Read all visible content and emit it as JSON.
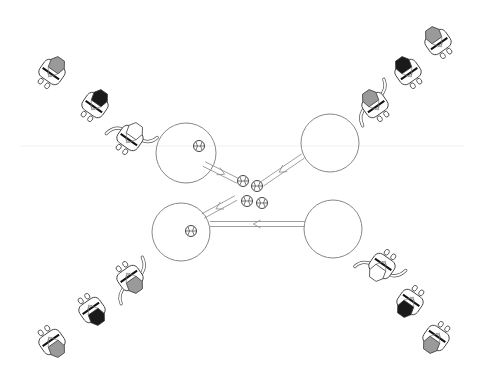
{
  "diagram": {
    "type": "drill-diagram",
    "background": "#ffffff",
    "stroke_color": "#777777",
    "colors": {
      "gray_shirt": "#9a9a9a",
      "black_shirt": "#1a1a1a",
      "outline": "#444444"
    },
    "guide_line_y": 146,
    "stations": [
      {
        "id": "top-left",
        "cx": 186,
        "cy": 153,
        "r": 30,
        "has_ball": true,
        "ball": [
          199,
          146
        ]
      },
      {
        "id": "top-right",
        "cx": 330,
        "cy": 143,
        "r": 29,
        "has_ball": false
      },
      {
        "id": "bottom-left",
        "cx": 181,
        "cy": 232,
        "r": 29,
        "has_ball": true,
        "ball": [
          191,
          231
        ]
      },
      {
        "id": "bottom-right",
        "cx": 333,
        "cy": 229,
        "r": 29,
        "has_ball": false
      }
    ],
    "center_balls": [
      [
        243,
        181
      ],
      [
        257,
        186
      ],
      [
        247,
        201
      ],
      [
        262,
        203
      ]
    ],
    "player_lines": [
      {
        "id": "line-top-left",
        "players": [
          {
            "x": 52,
            "y": 72,
            "angle": 35,
            "shirt": "gray",
            "role": "waiting"
          },
          {
            "x": 95,
            "y": 105,
            "angle": 35,
            "shirt": "black",
            "role": "waiting"
          },
          {
            "x": 130,
            "y": 138,
            "angle": 35,
            "shirt": "white",
            "role": "active"
          }
        ]
      },
      {
        "id": "line-top-right",
        "players": [
          {
            "x": 438,
            "y": 42,
            "angle": -35,
            "shirt": "gray",
            "role": "waiting"
          },
          {
            "x": 408,
            "y": 72,
            "angle": -35,
            "shirt": "black",
            "role": "waiting"
          },
          {
            "x": 375,
            "y": 105,
            "angle": -35,
            "shirt": "gray",
            "role": "active"
          }
        ]
      },
      {
        "id": "line-bottom-left",
        "players": [
          {
            "x": 52,
            "y": 342,
            "angle": 145,
            "shirt": "gray",
            "role": "waiting"
          },
          {
            "x": 92,
            "y": 310,
            "angle": 145,
            "shirt": "black",
            "role": "waiting"
          },
          {
            "x": 130,
            "y": 278,
            "angle": 145,
            "shirt": "gray",
            "role": "active"
          }
        ]
      },
      {
        "id": "line-bottom-right",
        "players": [
          {
            "x": 436,
            "y": 338,
            "angle": -145,
            "shirt": "gray",
            "role": "waiting"
          },
          {
            "x": 410,
            "y": 302,
            "angle": -145,
            "shirt": "black",
            "role": "waiting"
          },
          {
            "x": 382,
            "y": 266,
            "angle": -145,
            "shirt": "white",
            "role": "active"
          }
        ]
      }
    ],
    "paths": [
      {
        "id": "tl-to-center",
        "from": [
          204,
          164
        ],
        "to": [
          238,
          181
        ],
        "arrow": "toward-center"
      },
      {
        "id": "tr-to-center",
        "from": [
          303,
          156
        ],
        "to": [
          262,
          184
        ],
        "arrow": "toward-center"
      },
      {
        "id": "center-to-bl",
        "from": [
          236,
          198
        ],
        "to": [
          203,
          216
        ],
        "arrow": "toward-circle"
      },
      {
        "id": "br-to-bl",
        "from": [
          305,
          224
        ],
        "to": [
          210,
          224
        ],
        "arrow": "toward-left"
      }
    ]
  }
}
